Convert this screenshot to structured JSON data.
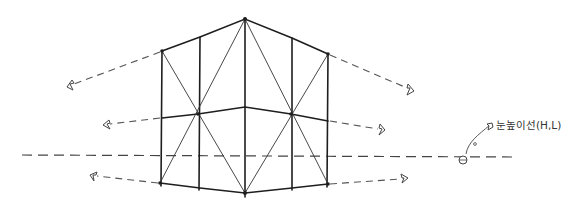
{
  "diagram": {
    "type": "two-point-perspective-sketch",
    "label": "눈높이선(H,L)",
    "colors": {
      "line": "#1e1e1e",
      "dashed": "#555555",
      "background": "#ffffff"
    },
    "verticals": [
      {
        "x": 162,
        "top": 51,
        "bottom": 183
      },
      {
        "x": 200,
        "top": 37,
        "bottom": 188
      },
      {
        "x": 245,
        "top": 19,
        "bottom": 193
      },
      {
        "x": 292,
        "top": 38,
        "bottom": 188
      },
      {
        "x": 328,
        "top": 54,
        "bottom": 184
      }
    ],
    "horizon_y": 155,
    "vanishing_arrows_left": [
      {
        "from": [
          162,
          51
        ],
        "to": [
          67,
          87
        ]
      },
      {
        "from": [
          162,
          118
        ],
        "to": [
          103,
          125
        ]
      },
      {
        "from": [
          162,
          183
        ],
        "to": [
          90,
          175
        ]
      }
    ],
    "vanishing_arrows_right": [
      {
        "from": [
          328,
          54
        ],
        "to": [
          414,
          91
        ]
      },
      {
        "from": [
          328,
          121
        ],
        "to": [
          385,
          130
        ]
      },
      {
        "from": [
          328,
          184
        ],
        "to": [
          408,
          178
        ]
      }
    ]
  }
}
